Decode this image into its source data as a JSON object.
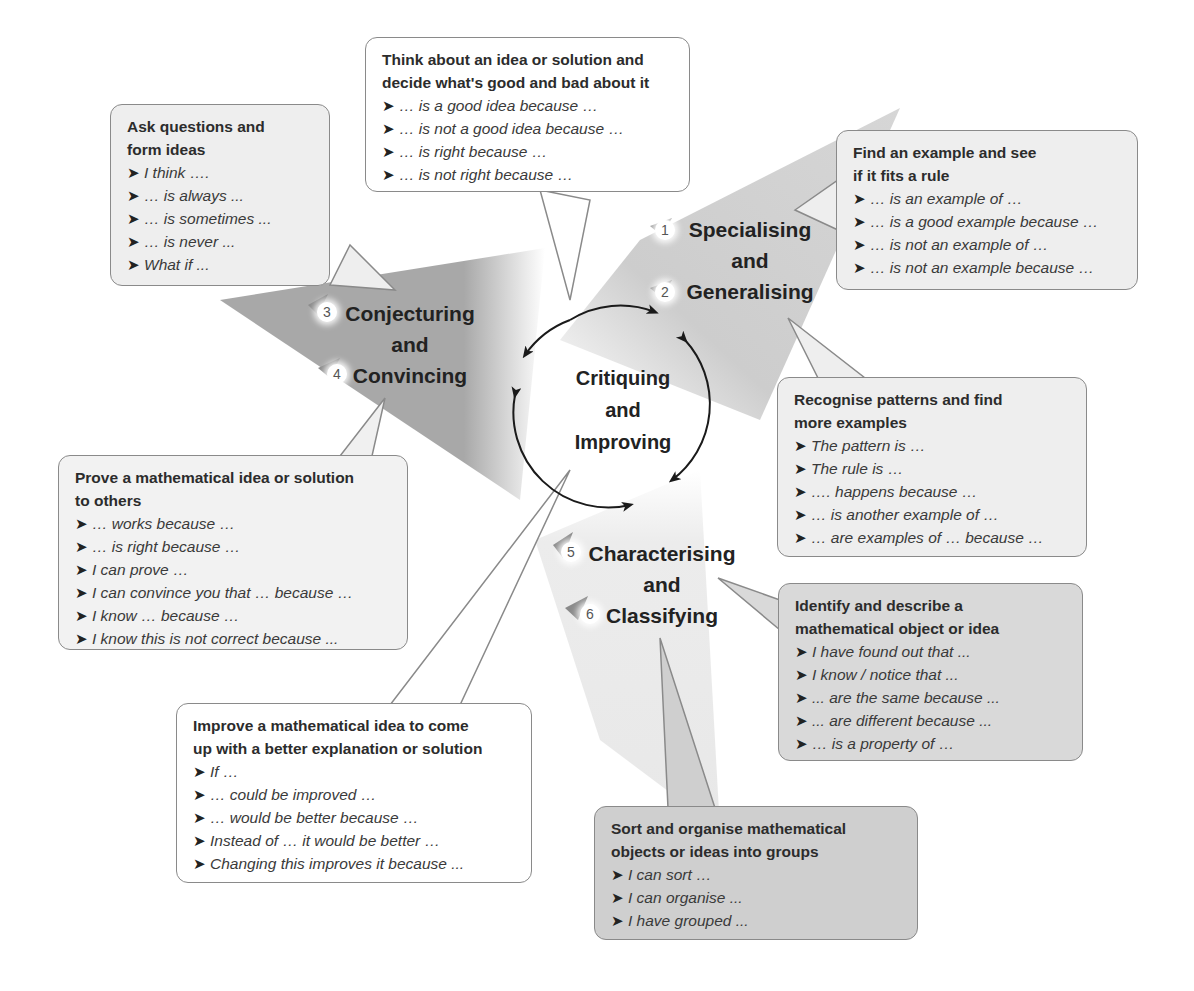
{
  "center": {
    "line1": "Critiquing",
    "line2": "and",
    "line3": "Improving"
  },
  "skills": [
    {
      "num_a": "1",
      "num_b": "2",
      "line1": "Specialising",
      "line2": "and",
      "line3": "Generalising"
    },
    {
      "num_a": "3",
      "num_b": "4",
      "line1": "Conjecturing",
      "line2": "and",
      "line3": "Convincing"
    },
    {
      "num_a": "5",
      "num_b": "6",
      "line1": "Characterising",
      "line2": "and",
      "line3": "Classifying"
    }
  ],
  "bubbles": {
    "critique": {
      "title1": "Think about an idea or solution and",
      "title2": "decide what's good and bad about it",
      "items": [
        "… is a good idea because …",
        "… is not a good idea because …",
        "… is right because …",
        "… is not right because …"
      ]
    },
    "ask": {
      "title1": "Ask questions and",
      "title2": "form ideas",
      "items": [
        "I think ….",
        "… is always ...",
        "… is sometimes ...",
        "… is never ...",
        "What if ..."
      ]
    },
    "find": {
      "title1": "Find an example and see",
      "title2": "if it fits a rule",
      "items": [
        "… is an example of …",
        "… is a good example because …",
        "… is not an example of …",
        "… is not an example because …"
      ]
    },
    "recognise": {
      "title1": "Recognise patterns and find",
      "title2": "more examples",
      "items": [
        "The pattern is …",
        "The rule is …",
        "…. happens because …",
        "… is another example of …",
        "… are examples of … because …"
      ]
    },
    "prove": {
      "title1": "Prove a mathematical idea or solution",
      "title2": "to others",
      "items": [
        "… works because …",
        "… is right because …",
        "I can prove …",
        "I can convince you that … because …",
        "I know … because …",
        "I know this is not correct because ..."
      ]
    },
    "identify": {
      "title1": "Identify and describe a",
      "title2": "mathematical object or idea",
      "items": [
        "I have found out that ...",
        "I know / notice that ...",
        "... are the same because ...",
        "... are different because ...",
        "… is a property of …"
      ]
    },
    "improve": {
      "title1": "Improve a mathematical idea to come",
      "title2": "up with a better explanation or solution",
      "items": [
        "If …",
        "… could be improved …",
        "… would be better because …",
        "Instead of … it would be better …",
        "Changing this improves it because ..."
      ]
    },
    "sort": {
      "title1": "Sort and organise mathematical",
      "title2": "objects or ideas into groups",
      "items": [
        "I can sort …",
        "I can organise ...",
        "I have grouped ..."
      ]
    }
  },
  "arrow_glyph": "➤",
  "colors": {
    "triangle_dark": "#a9a9a9",
    "triangle_light": "#e4e4e4",
    "bubble_border": "#8a8a8a"
  }
}
